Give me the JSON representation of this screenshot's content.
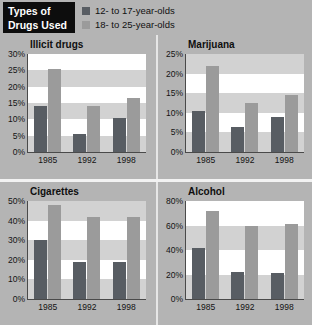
{
  "header": {
    "title_line1": "Types of",
    "title_line2": "Drugs Used",
    "legend": [
      {
        "label": "12- to 17-year-olds",
        "color": "#585d63",
        "swatch_name": "legend-swatch-12-17"
      },
      {
        "label": "18- to 25-year-olds",
        "color": "#9b9b9b",
        "swatch_name": "legend-swatch-18-25"
      }
    ]
  },
  "colors": {
    "background": "#b4b4b4",
    "title_block_bg": "#0d0d0d",
    "title_block_text": "#ffffff",
    "series_12_17": "#585d63",
    "series_18_25": "#9b9b9b",
    "plot_bg": "#ffffff",
    "plot_band": "#d2d2d2",
    "axis": "#4a4a4a",
    "divider": "#e6e6e6"
  },
  "chart_data": [
    {
      "type": "bar",
      "title": "Illicit drugs",
      "xlabel": "",
      "ylabel": "",
      "categories": [
        "1985",
        "1992",
        "1998"
      ],
      "yticks": [
        "0%",
        "5%",
        "10%",
        "15%",
        "20%",
        "25%",
        "30%"
      ],
      "ytick_values": [
        0,
        5,
        10,
        15,
        20,
        25,
        30
      ],
      "ylim": [
        0,
        30
      ],
      "grid": "horizontal-bands",
      "legend_position": "top-shared",
      "series": [
        {
          "name": "12- to 17-year-olds",
          "values": [
            14,
            5.5,
            10.5
          ]
        },
        {
          "name": "18- to 25-year-olds",
          "values": [
            25.5,
            14,
            16.5
          ]
        }
      ]
    },
    {
      "type": "bar",
      "title": "Marijuana",
      "xlabel": "",
      "ylabel": "",
      "categories": [
        "1985",
        "1992",
        "1998"
      ],
      "yticks": [
        "0%",
        "5%",
        "10%",
        "15%",
        "20%",
        "25%"
      ],
      "ytick_values": [
        0,
        5,
        10,
        15,
        20,
        25
      ],
      "ylim": [
        0,
        25
      ],
      "grid": "horizontal-bands",
      "legend_position": "top-shared",
      "series": [
        {
          "name": "12- to 17-year-olds",
          "values": [
            10.5,
            6.5,
            9
          ]
        },
        {
          "name": "18- to 25-year-olds",
          "values": [
            22,
            12.5,
            14.5
          ]
        }
      ]
    },
    {
      "type": "bar",
      "title": "Cigarettes",
      "xlabel": "",
      "ylabel": "",
      "categories": [
        "1985",
        "1992",
        "1998"
      ],
      "yticks": [
        "0%",
        "10%",
        "20%",
        "30%",
        "40%",
        "50%"
      ],
      "ytick_values": [
        0,
        10,
        20,
        30,
        40,
        50
      ],
      "ylim": [
        0,
        50
      ],
      "grid": "horizontal-bands",
      "legend_position": "top-shared",
      "series": [
        {
          "name": "12- to 17-year-olds",
          "values": [
            30,
            19,
            19
          ]
        },
        {
          "name": "18- to 25-year-olds",
          "values": [
            48,
            42,
            42
          ]
        }
      ]
    },
    {
      "type": "bar",
      "title": "Alcohol",
      "xlabel": "",
      "ylabel": "",
      "categories": [
        "1985",
        "1992",
        "1998"
      ],
      "yticks": [
        "0%",
        "20%",
        "40%",
        "60%",
        "80%"
      ],
      "ytick_values": [
        0,
        20,
        40,
        60,
        80
      ],
      "ylim": [
        0,
        80
      ],
      "grid": "horizontal-bands",
      "legend_position": "top-shared",
      "series": [
        {
          "name": "12- to 17-year-olds",
          "values": [
            42,
            22,
            21
          ]
        },
        {
          "name": "18- to 25-year-olds",
          "values": [
            72,
            60,
            61
          ]
        }
      ]
    }
  ]
}
